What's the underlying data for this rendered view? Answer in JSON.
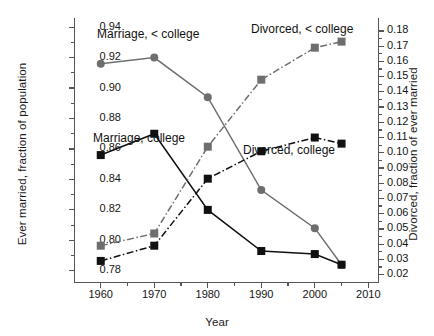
{
  "chart_data": {
    "type": "line",
    "title": "",
    "xlabel": "Year",
    "ylabel": "Ever married, fraction of population",
    "ylabel_right": "Divorced, fraction of ever married",
    "x": [
      1960,
      1970,
      1980,
      1990,
      2000,
      2005
    ],
    "xlim": [
      1955,
      2012
    ],
    "ylim": [
      0.772,
      0.946
    ],
    "ylim_right": [
      0.0145,
      0.1885
    ],
    "xticks": [
      1960,
      1970,
      1980,
      1990,
      2000,
      2010
    ],
    "xticklabels": [
      "1960",
      "1970",
      "1980",
      "1990",
      "2000",
      "2010"
    ],
    "yticks_left": [
      0.78,
      0.8,
      0.82,
      0.84,
      0.86,
      0.88,
      0.9,
      0.92,
      0.94
    ],
    "yticklabels_left": [
      "0.78",
      "0.80",
      "0.82",
      "0.84",
      "0.86",
      "0.88",
      "0.90",
      "0.92",
      "0.94"
    ],
    "yticks_right": [
      0.02,
      0.03,
      0.04,
      0.05,
      0.06,
      0.07,
      0.08,
      0.09,
      0.1,
      0.11,
      0.12,
      0.13,
      0.14,
      0.15,
      0.16,
      0.17,
      0.18
    ],
    "yticklabels_right": [
      "0.02",
      "0.03",
      "0.04",
      "0.05",
      "0.06",
      "0.07",
      "0.08",
      "0.09",
      "0.10",
      "0.11",
      "0.12",
      "0.13",
      "0.14",
      "0.15",
      "0.16",
      "0.17",
      "0.18"
    ],
    "grid": false,
    "legend_position": "inline-annotations",
    "series": [
      {
        "name": "Marriage, < college",
        "axis": "left",
        "color": "#6e6e6e",
        "marker": "circle",
        "linestyle": "solid",
        "values": [
          0.916,
          0.92,
          0.894,
          0.833,
          0.808,
          0.784
        ]
      },
      {
        "name": "Marriage, college",
        "axis": "left",
        "color": "#111111",
        "marker": "square",
        "linestyle": "solid",
        "values": [
          0.856,
          0.87,
          0.82,
          0.793,
          0.791,
          0.784
        ]
      },
      {
        "name": "Divorced, < college",
        "axis": "right",
        "color": "#6e6e6e",
        "marker": "square",
        "linestyle": "dashdot",
        "values": [
          0.039,
          0.047,
          0.104,
          0.148,
          0.169,
          0.173
        ]
      },
      {
        "name": "Divorced, college",
        "axis": "right",
        "color": "#111111",
        "marker": "square",
        "linestyle": "dashdot",
        "values": [
          0.029,
          0.039,
          0.083,
          0.101,
          0.11,
          0.106
        ]
      }
    ],
    "annotations": [
      {
        "text": "Marriage, < college",
        "x_px": 97,
        "y_px": 27
      },
      {
        "text": "Marriage, college",
        "x_px": 93,
        "y_px": 131
      },
      {
        "text": "Divorced, < college",
        "x_px": 251,
        "y_px": 22
      },
      {
        "text": "Divorced, college",
        "x_px": 243,
        "y_px": 143
      }
    ]
  }
}
